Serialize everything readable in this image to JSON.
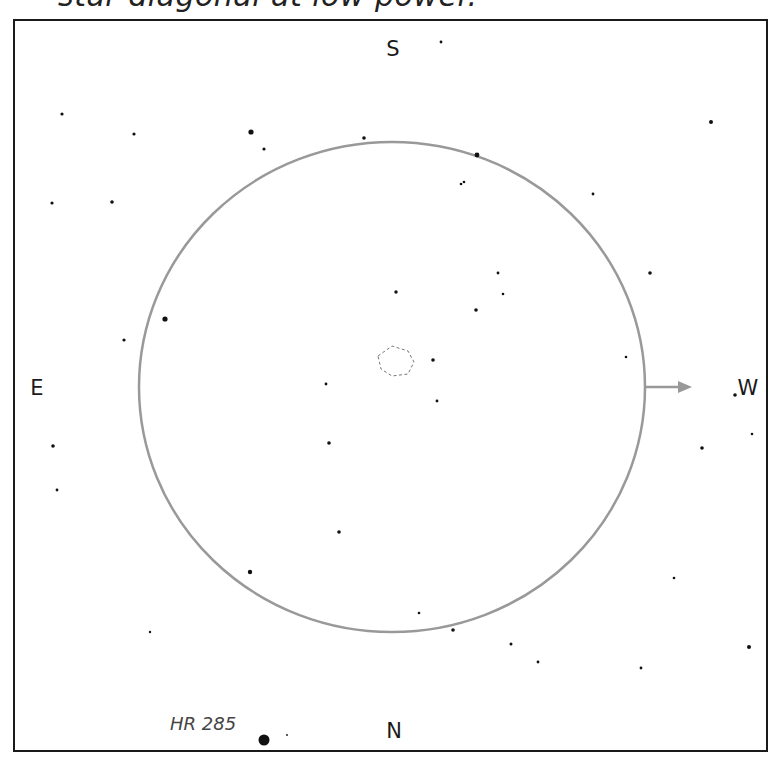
{
  "caption": "star diagonal at low power.",
  "directions": {
    "top": "S",
    "bottom": "N",
    "left": "E",
    "right": "W"
  },
  "field_of_view": {
    "cx": 392,
    "cy": 387,
    "rx": 253,
    "ry": 245,
    "color": "#999999"
  },
  "motion_arrow": {
    "x1": 645,
    "y1": 387,
    "x2": 692,
    "y2": 387,
    "color": "#999999"
  },
  "nebula": {
    "label": "",
    "outline": "dashed",
    "color": "#777777"
  },
  "labeled_star": {
    "name": "HR 285",
    "x": 264,
    "y": 740,
    "size": 5.5
  },
  "stars": [
    [
      441,
      42,
      1.4
    ],
    [
      62,
      114,
      1.6
    ],
    [
      134,
      134,
      1.6
    ],
    [
      251,
      132,
      2.6
    ],
    [
      264,
      149,
      1.6
    ],
    [
      364,
      138,
      1.8
    ],
    [
      477,
      155,
      2.4
    ],
    [
      461,
      184,
      1.3
    ],
    [
      464,
      182,
      1.3
    ],
    [
      711,
      122,
      2
    ],
    [
      593,
      194,
      1.4
    ],
    [
      52,
      203,
      1.6
    ],
    [
      112,
      202,
      1.8
    ],
    [
      498,
      273,
      1.4
    ],
    [
      650,
      273,
      1.8
    ],
    [
      503,
      294,
      1.3
    ],
    [
      396,
      292,
      1.7
    ],
    [
      476,
      310,
      1.8
    ],
    [
      165,
      319,
      2.6
    ],
    [
      124,
      340,
      1.6
    ],
    [
      626,
      357,
      1.3
    ],
    [
      433,
      360,
      1.8
    ],
    [
      326,
      384,
      1.4
    ],
    [
      437,
      401,
      1.4
    ],
    [
      735,
      395,
      1.8
    ],
    [
      752,
      434,
      1.3
    ],
    [
      702,
      448,
      1.8
    ],
    [
      53,
      446,
      1.8
    ],
    [
      329,
      443,
      1.8
    ],
    [
      57,
      490,
      1.4
    ],
    [
      339,
      532,
      1.8
    ],
    [
      250,
      572,
      2.2
    ],
    [
      674,
      578,
      1.3
    ],
    [
      419,
      613,
      1.3
    ],
    [
      453,
      630,
      1.8
    ],
    [
      150,
      632,
      1.2
    ],
    [
      511,
      644,
      1.5
    ],
    [
      538,
      662,
      1.4
    ],
    [
      641,
      668,
      1.4
    ],
    [
      749,
      647,
      2
    ],
    [
      287,
      735,
      0.9
    ]
  ]
}
